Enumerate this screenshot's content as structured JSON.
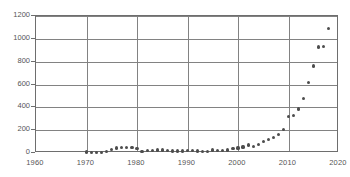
{
  "chart_data": {
    "type": "scatter",
    "title": "",
    "subtitle": "",
    "xlabel": "",
    "ylabel": "",
    "xlim": [
      1960,
      2020
    ],
    "ylim": [
      0,
      1200
    ],
    "grid": true,
    "legend": null,
    "legend_position": "none",
    "xticks": [
      1960,
      1970,
      1980,
      1990,
      2000,
      2010,
      2020
    ],
    "yticks": [
      0,
      200,
      400,
      600,
      800,
      1000,
      1200
    ],
    "xgridlines": [
      1970,
      1980,
      1990,
      2000,
      2010
    ],
    "ygridlines": [
      200,
      400,
      600,
      800,
      1000,
      1200
    ],
    "marker": "circle",
    "marker_color": "#4d4d4d",
    "axis_color": "#6e6e6e",
    "grid_color": "#828282",
    "background_color": "#ffffff",
    "series": [
      {
        "name": "",
        "points": [
          [
            1970,
            8
          ],
          [
            1971,
            7
          ],
          [
            1972,
            6
          ],
          [
            1973,
            7
          ],
          [
            1974,
            10
          ],
          [
            1975,
            30
          ],
          [
            1976,
            44
          ],
          [
            1977,
            46
          ],
          [
            1978,
            47
          ],
          [
            1979,
            45
          ],
          [
            1980,
            40
          ],
          [
            1981,
            14
          ],
          [
            1982,
            20
          ],
          [
            1983,
            24
          ],
          [
            1984,
            27
          ],
          [
            1985,
            27
          ],
          [
            1986,
            24
          ],
          [
            1987,
            18
          ],
          [
            1988,
            17
          ],
          [
            1989,
            18
          ],
          [
            1990,
            22
          ],
          [
            1991,
            22
          ],
          [
            1992,
            18
          ],
          [
            1993,
            14
          ],
          [
            1994,
            16
          ],
          [
            1995,
            26
          ],
          [
            1996,
            20
          ],
          [
            1997,
            19
          ],
          [
            1998,
            26
          ],
          [
            1999,
            36
          ],
          [
            2000,
            44
          ],
          [
            2001,
            52
          ],
          [
            2002,
            70
          ],
          [
            2003,
            58
          ],
          [
            2004,
            74
          ],
          [
            2005,
            100
          ],
          [
            2006,
            120
          ],
          [
            2007,
            136
          ],
          [
            2008,
            160
          ],
          [
            2009,
            205
          ],
          [
            2010,
            318
          ],
          [
            2011,
            330
          ],
          [
            2012,
            385
          ],
          [
            2013,
            480
          ],
          [
            2014,
            618
          ],
          [
            2015,
            762
          ],
          [
            2016,
            928
          ],
          [
            2017,
            930
          ],
          [
            2018,
            1090
          ]
        ]
      }
    ]
  },
  "axes": {
    "y_tick_labels": [
      "1200",
      "1000",
      "800",
      "600",
      "400",
      "200",
      "0"
    ],
    "x_tick_labels": [
      "1960",
      "1970",
      "1980",
      "1990",
      "2000",
      "2010",
      "2020"
    ]
  }
}
